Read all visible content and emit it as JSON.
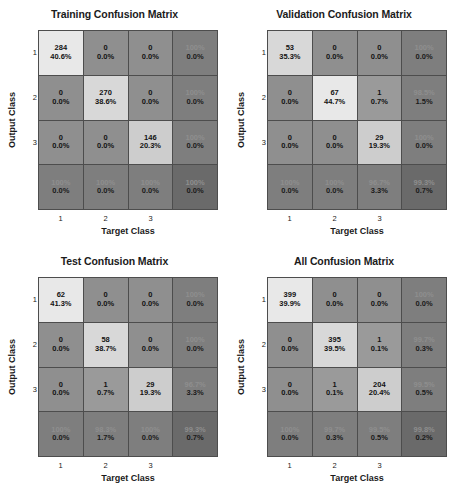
{
  "axes": {
    "xlabel": "Target Class",
    "ylabel": "Output Class",
    "xticks": [
      "1",
      "2",
      "3"
    ],
    "yticks": [
      "1",
      "2",
      "3"
    ]
  },
  "panels": [
    {
      "title": "Training Confusion Matrix",
      "cells": [
        [
          {
            "v1": "284",
            "v2": "40.6%",
            "kind": "diag-hi"
          },
          {
            "v1": "0",
            "v2": "0.0%",
            "kind": "off"
          },
          {
            "v1": "0",
            "v2": "0.0%",
            "kind": "off"
          },
          {
            "v1": "100%",
            "v2": "0.0%",
            "kind": "summary"
          }
        ],
        [
          {
            "v1": "0",
            "v2": "0.0%",
            "kind": "off"
          },
          {
            "v1": "270",
            "v2": "38.6%",
            "kind": "diag-mid"
          },
          {
            "v1": "0",
            "v2": "0.0%",
            "kind": "off"
          },
          {
            "v1": "100%",
            "v2": "0.0%",
            "kind": "summary"
          }
        ],
        [
          {
            "v1": "0",
            "v2": "0.0%",
            "kind": "off"
          },
          {
            "v1": "0",
            "v2": "0.0%",
            "kind": "off"
          },
          {
            "v1": "146",
            "v2": "20.3%",
            "kind": "diag-lo"
          },
          {
            "v1": "100%",
            "v2": "0.0%",
            "kind": "summary"
          }
        ],
        [
          {
            "v1": "100%",
            "v2": "0.0%",
            "kind": "summary"
          },
          {
            "v1": "100%",
            "v2": "0.0%",
            "kind": "summary"
          },
          {
            "v1": "100%",
            "v2": "0.0%",
            "kind": "summary"
          },
          {
            "v1": "100%",
            "v2": "0.0%",
            "kind": "corner"
          }
        ]
      ]
    },
    {
      "title": "Validation Confusion Matrix",
      "cells": [
        [
          {
            "v1": "53",
            "v2": "35.3%",
            "kind": "diag-mid"
          },
          {
            "v1": "0",
            "v2": "0.0%",
            "kind": "off"
          },
          {
            "v1": "0",
            "v2": "0.0%",
            "kind": "off"
          },
          {
            "v1": "100%",
            "v2": "0.0%",
            "kind": "summary"
          }
        ],
        [
          {
            "v1": "0",
            "v2": "0.0%",
            "kind": "off"
          },
          {
            "v1": "67",
            "v2": "44.7%",
            "kind": "diag-hi"
          },
          {
            "v1": "1",
            "v2": "0.7%",
            "kind": "off-lt"
          },
          {
            "v1": "98.5%",
            "v2": "1.5%",
            "kind": "summary"
          }
        ],
        [
          {
            "v1": "0",
            "v2": "0.0%",
            "kind": "off"
          },
          {
            "v1": "0",
            "v2": "0.0%",
            "kind": "off"
          },
          {
            "v1": "29",
            "v2": "19.3%",
            "kind": "diag-lo"
          },
          {
            "v1": "100%",
            "v2": "0.0%",
            "kind": "summary"
          }
        ],
        [
          {
            "v1": "100%",
            "v2": "0.0%",
            "kind": "summary"
          },
          {
            "v1": "100%",
            "v2": "0.0%",
            "kind": "summary"
          },
          {
            "v1": "96.7%",
            "v2": "3.3%",
            "kind": "summary"
          },
          {
            "v1": "99.3%",
            "v2": "0.7%",
            "kind": "corner"
          }
        ]
      ]
    },
    {
      "title": "Test Confusion Matrix",
      "cells": [
        [
          {
            "v1": "62",
            "v2": "41.3%",
            "kind": "diag-hi"
          },
          {
            "v1": "0",
            "v2": "0.0%",
            "kind": "off"
          },
          {
            "v1": "0",
            "v2": "0.0%",
            "kind": "off"
          },
          {
            "v1": "100%",
            "v2": "0.0%",
            "kind": "summary"
          }
        ],
        [
          {
            "v1": "0",
            "v2": "0.0%",
            "kind": "off"
          },
          {
            "v1": "58",
            "v2": "38.7%",
            "kind": "diag-mid"
          },
          {
            "v1": "0",
            "v2": "0.0%",
            "kind": "off"
          },
          {
            "v1": "100%",
            "v2": "0.0%",
            "kind": "summary"
          }
        ],
        [
          {
            "v1": "0",
            "v2": "0.0%",
            "kind": "off"
          },
          {
            "v1": "1",
            "v2": "0.7%",
            "kind": "off-lt"
          },
          {
            "v1": "29",
            "v2": "19.3%",
            "kind": "diag-lo"
          },
          {
            "v1": "96.7%",
            "v2": "3.3%",
            "kind": "summary"
          }
        ],
        [
          {
            "v1": "100%",
            "v2": "0.0%",
            "kind": "summary"
          },
          {
            "v1": "98.3%",
            "v2": "1.7%",
            "kind": "summary"
          },
          {
            "v1": "100%",
            "v2": "0.0%",
            "kind": "summary"
          },
          {
            "v1": "99.3%",
            "v2": "0.7%",
            "kind": "corner"
          }
        ]
      ]
    },
    {
      "title": "All Confusion Matrix",
      "cells": [
        [
          {
            "v1": "399",
            "v2": "39.9%",
            "kind": "diag-hi"
          },
          {
            "v1": "0",
            "v2": "0.0%",
            "kind": "off"
          },
          {
            "v1": "0",
            "v2": "0.0%",
            "kind": "off"
          },
          {
            "v1": "100%",
            "v2": "0.0%",
            "kind": "summary"
          }
        ],
        [
          {
            "v1": "0",
            "v2": "0.0%",
            "kind": "off"
          },
          {
            "v1": "395",
            "v2": "39.5%",
            "kind": "diag-mid"
          },
          {
            "v1": "1",
            "v2": "0.1%",
            "kind": "off-lt"
          },
          {
            "v1": "99.7%",
            "v2": "0.3%",
            "kind": "summary"
          }
        ],
        [
          {
            "v1": "0",
            "v2": "0.0%",
            "kind": "off"
          },
          {
            "v1": "1",
            "v2": "0.1%",
            "kind": "off-lt"
          },
          {
            "v1": "204",
            "v2": "20.4%",
            "kind": "diag-lo"
          },
          {
            "v1": "99.5%",
            "v2": "0.5%",
            "kind": "summary"
          }
        ],
        [
          {
            "v1": "100%",
            "v2": "0.0%",
            "kind": "summary"
          },
          {
            "v1": "99.7%",
            "v2": "0.3%",
            "kind": "summary"
          },
          {
            "v1": "99.5%",
            "v2": "0.5%",
            "kind": "summary"
          },
          {
            "v1": "99.8%",
            "v2": "0.2%",
            "kind": "corner"
          }
        ]
      ]
    }
  ],
  "chart_data": {
    "type": "heatmap",
    "xlabel": "Target Class",
    "ylabel": "Output Class",
    "classes": [
      "1",
      "2",
      "3"
    ],
    "matrices": [
      {
        "name": "Training",
        "counts": [
          [
            284,
            0,
            0
          ],
          [
            0,
            270,
            0
          ],
          [
            0,
            0,
            146
          ]
        ],
        "percent_of_total": [
          [
            40.6,
            0.0,
            0.0
          ],
          [
            0.0,
            38.6,
            0.0
          ],
          [
            0.0,
            0.0,
            20.3
          ]
        ],
        "row_precision": [
          100.0,
          100.0,
          100.0
        ],
        "row_error": [
          0.0,
          0.0,
          0.0
        ],
        "col_recall": [
          100.0,
          100.0,
          100.0
        ],
        "col_error": [
          0.0,
          0.0,
          0.0
        ],
        "overall_accuracy": 100.0,
        "overall_error": 0.0,
        "total": 700
      },
      {
        "name": "Validation",
        "counts": [
          [
            53,
            0,
            0
          ],
          [
            0,
            67,
            1
          ],
          [
            0,
            0,
            29
          ]
        ],
        "percent_of_total": [
          [
            35.3,
            0.0,
            0.0
          ],
          [
            0.0,
            44.7,
            0.7
          ],
          [
            0.0,
            0.0,
            19.3
          ]
        ],
        "row_precision": [
          100.0,
          98.5,
          100.0
        ],
        "row_error": [
          0.0,
          1.5,
          0.0
        ],
        "col_recall": [
          100.0,
          100.0,
          96.7
        ],
        "col_error": [
          0.0,
          0.0,
          3.3
        ],
        "overall_accuracy": 99.3,
        "overall_error": 0.7,
        "total": 150
      },
      {
        "name": "Test",
        "counts": [
          [
            62,
            0,
            0
          ],
          [
            0,
            58,
            0
          ],
          [
            0,
            1,
            29
          ]
        ],
        "percent_of_total": [
          [
            41.3,
            0.0,
            0.0
          ],
          [
            0.0,
            38.7,
            0.0
          ],
          [
            0.0,
            0.7,
            19.3
          ]
        ],
        "row_precision": [
          100.0,
          100.0,
          96.7
        ],
        "row_error": [
          0.0,
          0.0,
          3.3
        ],
        "col_recall": [
          100.0,
          98.3,
          100.0
        ],
        "col_error": [
          0.0,
          1.7,
          0.0
        ],
        "overall_accuracy": 99.3,
        "overall_error": 0.7,
        "total": 150
      },
      {
        "name": "All",
        "counts": [
          [
            399,
            0,
            0
          ],
          [
            0,
            395,
            1
          ],
          [
            0,
            1,
            204
          ]
        ],
        "percent_of_total": [
          [
            39.9,
            0.0,
            0.0
          ],
          [
            0.0,
            39.5,
            0.1
          ],
          [
            0.0,
            0.1,
            20.4
          ]
        ],
        "row_precision": [
          100.0,
          99.7,
          99.5
        ],
        "row_error": [
          0.0,
          0.3,
          0.5
        ],
        "col_recall": [
          100.0,
          99.7,
          99.5
        ],
        "col_error": [
          0.0,
          0.3,
          0.5
        ],
        "overall_accuracy": 99.8,
        "overall_error": 0.2,
        "total": 1000
      }
    ]
  }
}
